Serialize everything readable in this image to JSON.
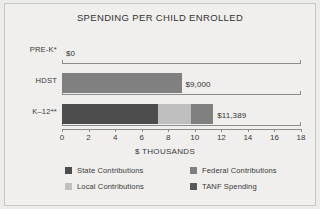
{
  "chart_data": {
    "type": "bar",
    "orientation": "horizontal",
    "stacked": true,
    "title": "SPENDING PER CHILD ENROLLED",
    "xlabel": "$ THOUSANDS",
    "ylabel": "",
    "xlim": [
      0,
      18
    ],
    "xticks": [
      0,
      2,
      4,
      6,
      8,
      10,
      12,
      14,
      16,
      18
    ],
    "xtick_labels": [
      "0",
      "2",
      "4",
      "6",
      "8",
      "10",
      "12",
      "14",
      "16",
      "18"
    ],
    "grid": false,
    "legend_position": "bottom",
    "categories": [
      "PRE-K*",
      "HDST",
      "K–12**"
    ],
    "series": [
      {
        "name": "State Contributions",
        "color": "#4d4d4d",
        "values": [
          0,
          0,
          7.2
        ]
      },
      {
        "name": "Local Contributions",
        "color": "#bfbfbf",
        "values": [
          0,
          0,
          2.5
        ]
      },
      {
        "name": "Federal Contributions",
        "color": "#808080",
        "values": [
          0,
          9.0,
          1.689
        ]
      },
      {
        "name": "TANF Spending",
        "color": "#595959",
        "values": [
          0,
          0,
          0
        ]
      }
    ],
    "totals": [
      0,
      9.0,
      11.389
    ],
    "data_labels": [
      "$0",
      "$9,000",
      "$11,389"
    ],
    "annotations": [
      "* PRE-K spending shown as $0",
      "** K–12 total $11,389"
    ]
  },
  "legend": {
    "items": [
      {
        "label": "State Contributions",
        "color": "#4d4d4d"
      },
      {
        "label": "Federal Contributions",
        "color": "#808080"
      },
      {
        "label": "Local Contributions",
        "color": "#bfbfbf"
      },
      {
        "label": "TANF Spending",
        "color": "#595959"
      }
    ]
  }
}
